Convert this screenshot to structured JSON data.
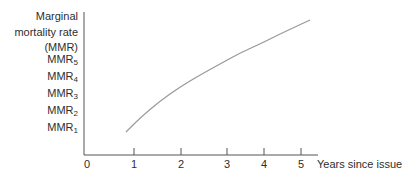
{
  "chart_data": {
    "type": "line",
    "title": "",
    "ylabel": [
      "Marginal",
      "mortality rate",
      "(MMR)"
    ],
    "xlabel": "Years since issue",
    "x_ticks": [
      {
        "label": "0",
        "px": 87
      },
      {
        "label": "1",
        "px": 134
      },
      {
        "label": "2",
        "px": 181
      },
      {
        "label": "3",
        "px": 227
      },
      {
        "label": "4",
        "px": 264
      },
      {
        "label": "5",
        "px": 301
      }
    ],
    "y_tick_labels": [
      {
        "base": "MMR",
        "sub": "5",
        "py": 60
      },
      {
        "base": "MMR",
        "sub": "4",
        "py": 77
      },
      {
        "base": "MMR",
        "sub": "3",
        "py": 94
      },
      {
        "base": "MMR",
        "sub": "2",
        "py": 111
      },
      {
        "base": "MMR",
        "sub": "1",
        "py": 128
      }
    ],
    "series": [
      {
        "name": "Marginal mortality rate curve",
        "color": "#9a9a9a",
        "points_px": [
          [
            126,
            132
          ],
          [
            140,
            118
          ],
          [
            160,
            101
          ],
          [
            180,
            87
          ],
          [
            200,
            75
          ],
          [
            220,
            64
          ],
          [
            240,
            53
          ],
          [
            260,
            44
          ],
          [
            280,
            34
          ],
          [
            295,
            27
          ],
          [
            310,
            20
          ]
        ]
      }
    ],
    "grid": false,
    "legend": null,
    "axes": {
      "origin_px": [
        84,
        155
      ],
      "y_top_px": 12,
      "x_right_px": 318,
      "color": "#555555"
    }
  },
  "labels": {
    "y_title_1": "Marginal",
    "y_title_2": "mortality rate",
    "y_title_3": "(MMR)",
    "mmr": "MMR",
    "mmr5_sub": "5",
    "mmr4_sub": "4",
    "mmr3_sub": "3",
    "mmr2_sub": "2",
    "mmr1_sub": "1",
    "x0": "0",
    "x1": "1",
    "x2": "2",
    "x3": "3",
    "x4": "4",
    "x5": "5",
    "x_title": "Years since issue"
  }
}
